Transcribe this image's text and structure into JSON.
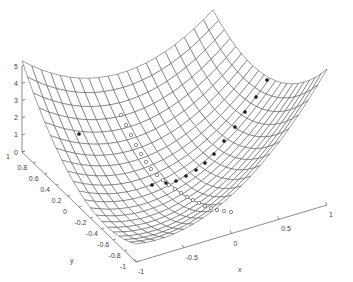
{
  "chart_data": {
    "type": "surface3d",
    "title": "",
    "xlabel": "x",
    "ylabel": "y",
    "zlabel": "",
    "xlim": [
      -1,
      1
    ],
    "ylim": [
      -1,
      1
    ],
    "zlim": [
      0,
      5
    ],
    "x_ticks": [
      -1,
      -0.5,
      0,
      0.5,
      1
    ],
    "x_tick_labels": [
      "-1",
      "-0.5",
      "0",
      "0.5",
      "1"
    ],
    "y_ticks": [
      -1,
      -0.8,
      -0.6,
      -0.4,
      -0.2,
      0,
      0.2,
      0.4,
      0.6,
      0.8,
      1
    ],
    "y_tick_labels": [
      "-1",
      "-0.8",
      "-0.6",
      "-0.4",
      "-0.2",
      "0",
      "0.2",
      "0.4",
      "0.6",
      "0.8",
      "1"
    ],
    "z_ticks": [
      0,
      1,
      2,
      3,
      4,
      5
    ],
    "z_tick_labels": [
      "0",
      "1",
      "2",
      "3",
      "4",
      "5"
    ],
    "grid": false,
    "surface": {
      "kind": "mesh",
      "description": "quadratic bowl (convex function) over [-1,1]x[-1,1]",
      "function": "A*x^2 + B*y^2 + C*x*y + D*x + E*y + G",
      "coefficients": {
        "A": 2.25,
        "B": 2.25,
        "C": -1.8,
        "D": 1.625,
        "E": 0.325,
        "G": 0.3
      },
      "grid_points": 21,
      "corner_values_approx": {
        "x-1_y1": 5.0,
        "x1_y1": 4.65,
        "x1_y-1": 7.6,
        "x-1_y-1": 0.75
      }
    },
    "series": [
      {
        "name": "filled-marker path",
        "marker": "filled-circle",
        "screen_points": [
          [
            79,
            134
          ],
          [
            152,
            185
          ],
          [
            166,
            183
          ],
          [
            176,
            181
          ],
          [
            186,
            176
          ],
          [
            196,
            170
          ],
          [
            205,
            163
          ],
          [
            214,
            154
          ],
          [
            224,
            141
          ],
          [
            235,
            127
          ],
          [
            245,
            112
          ],
          [
            256,
            97
          ],
          [
            267,
            80
          ]
        ]
      },
      {
        "name": "open-marker path",
        "marker": "open-circle",
        "screen_points": [
          [
            121,
            115
          ],
          [
            126,
            125
          ],
          [
            131,
            135
          ],
          [
            136,
            145
          ],
          [
            141,
            154
          ],
          [
            146,
            162
          ],
          [
            151,
            169
          ],
          [
            157,
            175
          ],
          [
            163,
            180
          ],
          [
            169,
            185
          ],
          [
            175,
            189
          ],
          [
            181,
            193
          ],
          [
            187,
            197
          ],
          [
            193,
            200
          ],
          [
            199,
            203
          ],
          [
            205,
            206
          ],
          [
            211,
            208
          ],
          [
            217,
            210
          ],
          [
            224,
            211
          ],
          [
            231,
            212
          ]
        ]
      }
    ]
  },
  "projection": {
    "origin_screen": [
      174.5,
      178.5
    ],
    "x_unit": [
      95.5,
      -28.5
    ],
    "y_unit": [
      -57,
      -55
    ],
    "z_unit": [
      0,
      -17.2
    ]
  },
  "labels": {
    "x": "x",
    "y": "y"
  }
}
